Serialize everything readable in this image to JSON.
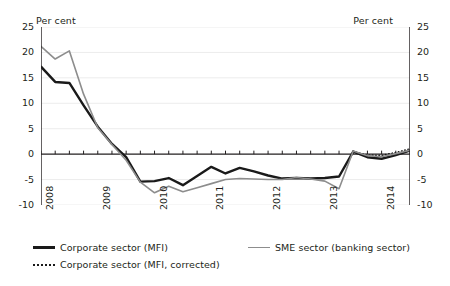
{
  "axis": {
    "unit_left": "Per cent",
    "unit_right": "Per cent",
    "y_ticks": [
      "25",
      "20",
      "15",
      "10",
      "5",
      "0",
      "-5",
      "-10"
    ],
    "x_ticks": [
      "2008",
      "2009",
      "2010",
      "2011",
      "2012",
      "2013",
      "2014"
    ]
  },
  "legend": {
    "corporate": {
      "label": "Corporate sector (MFI)",
      "marker": "solid-thick-black-line-icon",
      "color": "#1a1a1a"
    },
    "corrected": {
      "label": "Corporate sector (MFI, corrected)",
      "marker": "dotted-black-line-icon",
      "color": "#1a1a1a"
    },
    "sme": {
      "label": "SME sector (banking sector)",
      "marker": "solid-gray-line-icon",
      "color": "#8d8d8d"
    }
  },
  "chart_data": {
    "type": "line",
    "title": "",
    "xlabel": "",
    "ylabel": "Per cent",
    "ylim": [
      -10,
      25
    ],
    "ytick_step": 5,
    "xlim": [
      "2008 Q1",
      "2014 Q3"
    ],
    "grid": true,
    "grid_axis": "y",
    "zero_line": true,
    "legend_position": "bottom",
    "x": [
      "2008 Q1",
      "2008 Q2",
      "2008 Q3",
      "2008 Q4",
      "2009 Q1",
      "2009 Q2",
      "2009 Q3",
      "2009 Q4",
      "2010 Q1",
      "2010 Q2",
      "2010 Q3",
      "2010 Q4",
      "2011 Q1",
      "2011 Q2",
      "2011 Q3",
      "2011 Q4",
      "2012 Q1",
      "2012 Q2",
      "2012 Q3",
      "2012 Q4",
      "2013 Q1",
      "2013 Q2",
      "2013 Q3",
      "2013 Q4",
      "2014 Q1",
      "2014 Q2",
      "2014 Q3"
    ],
    "series": [
      {
        "name": "Corporate sector (MFI)",
        "color": "#1a1a1a",
        "style": "solid",
        "width": 2.4,
        "values": [
          17.2,
          14.2,
          14.0,
          9.6,
          5.4,
          2.0,
          -0.6,
          -5.4,
          -5.3,
          -4.7,
          -6.1,
          -4.3,
          -2.5,
          -3.8,
          -2.7,
          -3.4,
          -4.2,
          -4.8,
          -4.7,
          -4.8,
          -4.7,
          -4.4,
          0.5,
          -0.6,
          -0.9,
          -0.2,
          0.7
        ]
      },
      {
        "name": "Corporate sector (MFI, corrected)",
        "color": "#1a1a1a",
        "style": "dotted",
        "width": 2.0,
        "values": [
          null,
          null,
          null,
          null,
          null,
          null,
          null,
          null,
          null,
          null,
          null,
          null,
          null,
          null,
          null,
          null,
          null,
          null,
          null,
          null,
          null,
          null,
          0.5,
          -0.2,
          -0.3,
          0.3,
          1.0
        ]
      },
      {
        "name": "SME sector (banking sector)",
        "color": "#8d8d8d",
        "style": "solid",
        "width": 1.6,
        "values": [
          21.2,
          18.7,
          20.3,
          11.8,
          5.2,
          1.9,
          -1.2,
          -5.5,
          -7.6,
          -6.3,
          -7.4,
          -6.6,
          -5.8,
          -5.0,
          -4.8,
          -4.9,
          -5.0,
          -5.0,
          -4.6,
          -4.9,
          -5.3,
          -6.8,
          0.6,
          -0.3,
          -0.5,
          0.1,
          0.8
        ]
      }
    ]
  }
}
